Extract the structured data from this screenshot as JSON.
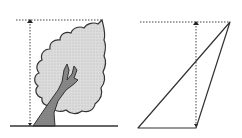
{
  "figure": {
    "panels": [
      {
        "name": "tree",
        "description": "Tree with dotted height measurement"
      },
      {
        "name": "triangle",
        "description": "Triangle with dotted height measurement"
      }
    ]
  },
  "colors": {
    "stroke": "#333333",
    "dotted": "#444444",
    "crown_fill": "#d4d4d4",
    "trunk_fill": "#8a8a8a",
    "background": "#ffffff"
  }
}
